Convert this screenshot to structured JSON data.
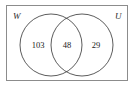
{
  "figure": {
    "type": "venn-diagram",
    "sets": 2,
    "background_color": "#ffffff",
    "universe": {
      "name": "universal-set-rectangle",
      "stroke_color": "#8c8c8c",
      "fill_color": "#ffffff",
      "x": 6,
      "y": 5,
      "width": 122,
      "height": 76
    },
    "circles": [
      {
        "label": "W",
        "name": "circle-w",
        "cx": 51,
        "cy": 45,
        "r": 31,
        "stroke_color": "#4a4a4a"
      },
      {
        "label": "U",
        "name": "circle-u",
        "cx": 82,
        "cy": 45,
        "r": 31,
        "stroke_color": "#4a4a4a"
      }
    ],
    "labels": {
      "left_set": "W",
      "right_set": "U"
    },
    "regions": [
      {
        "name": "w-only",
        "description": "W only",
        "value": "103",
        "x": 38,
        "y": 48
      },
      {
        "name": "w-and-u",
        "description": "W intersect U",
        "value": "48",
        "x": 67,
        "y": 48
      },
      {
        "name": "u-only",
        "description": "U only",
        "value": "29",
        "x": 96,
        "y": 48
      }
    ]
  }
}
